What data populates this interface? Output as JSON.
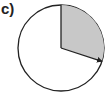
{
  "figure": {
    "label": "c)",
    "circle": {
      "cx": 61,
      "cy": 48,
      "r": 43
    },
    "sector": {
      "start_angle_deg": 0,
      "end_angle_deg": 108,
      "direction": "clockwise from top",
      "fill": "#c8c8c8"
    },
    "colors": {
      "stroke": "#222222",
      "background": "#ffffff"
    }
  }
}
